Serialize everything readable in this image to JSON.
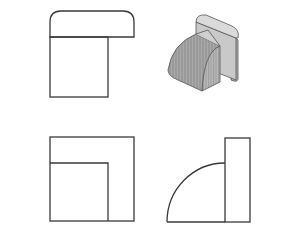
{
  "figure": {
    "stroke_color": "#3a3a3a",
    "shade_light": "#d6d6d6",
    "shade_mid": "#b5b5b5",
    "shade_dark": "#8f8f8f",
    "views": [
      {
        "name": "top-left view",
        "position": "top-left"
      },
      {
        "name": "isometric pictorial",
        "position": "top-right"
      },
      {
        "name": "bottom-left view",
        "position": "bottom-left"
      },
      {
        "name": "bottom-right view",
        "position": "bottom-right"
      }
    ],
    "caption": ""
  }
}
